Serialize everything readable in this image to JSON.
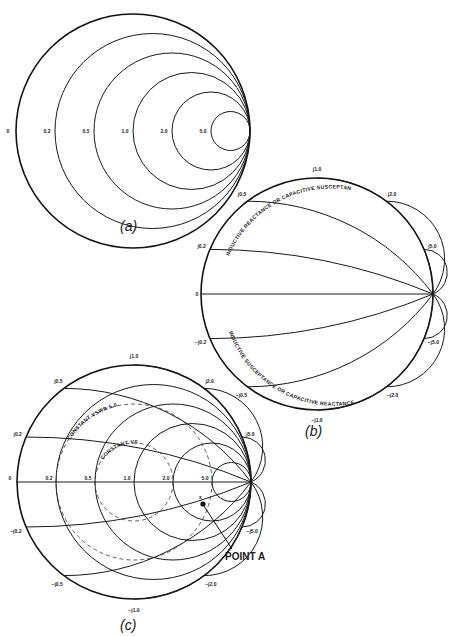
{
  "figure": {
    "panel_a": {
      "caption": "(a)",
      "description": "Constant resistance circles",
      "resistance_labels": [
        "0",
        "0.2",
        "0.5",
        "1.0",
        "2.0",
        "5.0"
      ],
      "resistance_values": [
        0,
        0.2,
        0.5,
        1.0,
        2.0,
        5.0
      ]
    },
    "panel_b": {
      "caption": "(b)",
      "description": "Constant reactance arcs",
      "center_label": "0",
      "upper_labels": [
        "j0.2",
        "j0.5",
        "j1.0",
        "j2.0",
        "j5.0"
      ],
      "lower_labels": [
        "−j0.2",
        "−j0.5",
        "−j1.0",
        "−j2.0",
        "−j5.0"
      ],
      "reactance_values": [
        0.2,
        0.5,
        1.0,
        2.0,
        5.0
      ],
      "upper_arc_text": "INDUCTIVE REACTANCE OR CAPACITIVE SUSCEPTANCE",
      "lower_arc_text": "INDUCTIVE SUSCEPTANCE OR CAPACITIVE REACTANCE"
    },
    "panel_c": {
      "caption": "(c)",
      "description": "Complete Smith chart with constant VSWR circles",
      "resistance_labels": [
        "0",
        "0.2",
        "0.5",
        "1.0",
        "2.0",
        "5.0"
      ],
      "upper_labels": [
        "j0.2",
        "j0.5",
        "j1.0",
        "j2.0",
        "j5.0"
      ],
      "lower_labels": [
        "−j0.2",
        "−j0.5",
        "−j1.0",
        "−j2.0",
        "−j5.0"
      ],
      "vswr_circles": [
        {
          "label": "CONSTANT VSWR 5.0",
          "vswr": 5.0
        },
        {
          "label": "CONSTANT VSWR 2.0",
          "vswr": 2.0
        }
      ],
      "point_marker": "x",
      "point_label": "POINT A"
    }
  }
}
